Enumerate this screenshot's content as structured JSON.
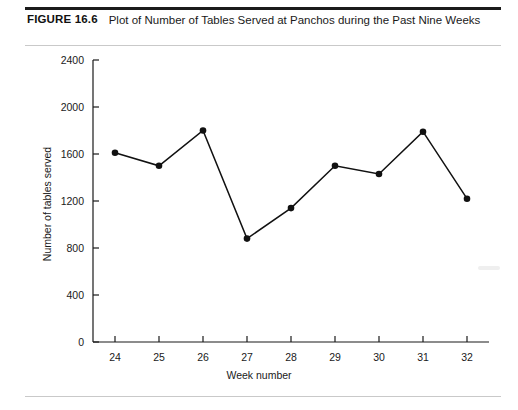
{
  "figure": {
    "label": "FIGURE 16.6",
    "title": "Plot of Number of Tables Served at Panchos during the Past Nine Weeks"
  },
  "chart_data": {
    "type": "line",
    "title": "Plot of Number of Tables Served at Panchos during the Past Nine Weeks",
    "xlabel": "Week number",
    "ylabel": "Number of tables served",
    "categories": [
      24,
      25,
      26,
      27,
      28,
      29,
      30,
      31,
      32
    ],
    "values": [
      1610,
      1500,
      1800,
      880,
      1140,
      1500,
      1430,
      1790,
      1220
    ],
    "series": [
      {
        "name": "Number of tables served",
        "values": [
          1610,
          1500,
          1800,
          880,
          1140,
          1500,
          1430,
          1790,
          1220
        ]
      }
    ],
    "xlim": [
      23.5,
      32.5
    ],
    "ylim": [
      0,
      2400
    ],
    "yticks": [
      0,
      400,
      800,
      1200,
      1600,
      2000,
      2400
    ],
    "xticks": [
      24,
      25,
      26,
      27,
      28,
      29,
      30,
      31,
      32
    ],
    "grid": false,
    "legend": false,
    "marker": "filled-circle",
    "line_color": "#111111",
    "marker_color": "#111111"
  }
}
